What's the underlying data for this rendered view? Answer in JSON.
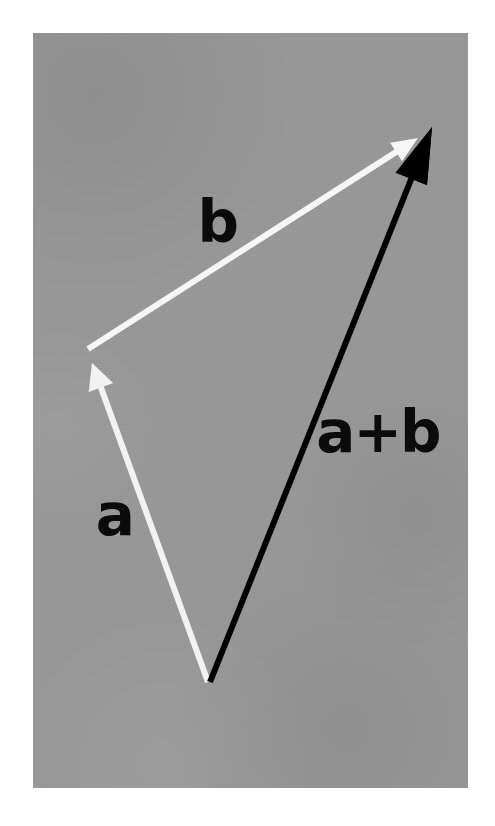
{
  "figure": {
    "kind": "vector-addition-diagram",
    "caption_absent": true,
    "plate": {
      "background_color": "#989898",
      "page_color": "#ffffff",
      "left": 33,
      "top": 33,
      "width": 435,
      "height": 755
    }
  },
  "labels": {
    "vector_a": "a",
    "vector_b": "b",
    "vector_sum": "a+b"
  },
  "chart_data": {
    "type": "diagram",
    "title": "",
    "subtitle": "",
    "xlabel": "",
    "ylabel": "",
    "grid": false,
    "legend_position": "none",
    "coordinate_space": "pixels, origin top-left of 495x826 image",
    "background_color": "#989898",
    "vectors": [
      {
        "name": "a",
        "label": "a",
        "color": "#f2f2f2",
        "stroke_width": 6,
        "tail": [
          208,
          682
        ],
        "tip": [
          92,
          363
        ],
        "arrowhead": "filled-triangle-small",
        "label_position": [
          115,
          515
        ]
      },
      {
        "name": "b",
        "label": "b",
        "color": "#f6f6f6",
        "stroke_width": 6,
        "tail": [
          88,
          349
        ],
        "tip": [
          418,
          138
        ],
        "arrowhead": "filled-triangle-small",
        "label_position": [
          218,
          222
        ]
      },
      {
        "name": "a+b",
        "label": "a+b",
        "color": "#000000",
        "stroke_width": 6,
        "tail": [
          210,
          682
        ],
        "tip": [
          432,
          127
        ],
        "arrowhead": "filled-triangle-large",
        "label_position": [
          378,
          432
        ]
      }
    ],
    "annotations": [
      {
        "text": "b",
        "x": 218,
        "y": 222,
        "color": "#0b0b0b",
        "weight": "bold"
      },
      {
        "text": "a",
        "x": 115,
        "y": 515,
        "color": "#0b0b0b",
        "weight": "bold"
      },
      {
        "text": "a+b",
        "x": 378,
        "y": 432,
        "color": "#0b0b0b",
        "weight": "bold"
      }
    ]
  }
}
